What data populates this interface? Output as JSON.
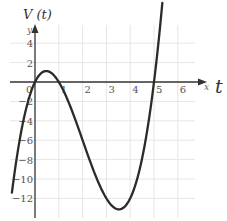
{
  "chart_data": {
    "type": "line",
    "title": "V (t)",
    "xlabel": "t",
    "xaxis_small_label": "x",
    "yaxis_small_label": "y",
    "xlim": [
      -1,
      6.5
    ],
    "ylim": [
      -13,
      5
    ],
    "grid": true,
    "x_ticks": [
      "0",
      "1",
      "2",
      "3",
      "4",
      "5",
      "6"
    ],
    "y_ticks": [
      "4",
      "2",
      "-2",
      "-4",
      "-6",
      "-8",
      "-10",
      "-12"
    ],
    "series": [
      {
        "name": "V(t)",
        "formula_estimate": "t(t-1)(t-5)",
        "x": [
          -0.97,
          -0.5,
          0,
          0.5,
          1,
          1.5,
          2,
          2.5,
          3,
          3.5,
          4,
          4.5,
          5,
          5.35
        ],
        "y": [
          -11.4,
          -4.1,
          0,
          1.1,
          0,
          -2.6,
          -6,
          -9.4,
          -12,
          -13.1,
          -12,
          -7.9,
          0,
          8.1
        ]
      }
    ],
    "roots": [
      0,
      1,
      5
    ],
    "local_max": {
      "x": 0.5,
      "y": 1.1
    },
    "local_min": {
      "x": 3.5,
      "y": -13.1
    },
    "line_color": "#2b2b2b",
    "grid_color": "#e6e6e6"
  }
}
